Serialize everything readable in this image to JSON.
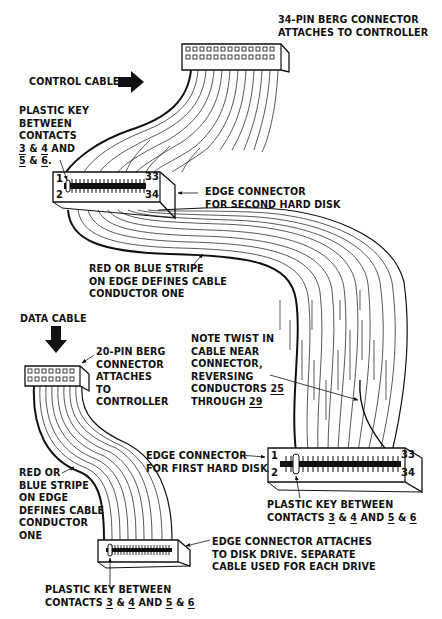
{
  "diagram": {
    "control_cable": {
      "heading": "CONTROL CABLE",
      "berg_connector": [
        "34-PIN BERG CONNECTOR",
        "ATTACHES TO CONTROLLER"
      ],
      "key_label": [
        "PLASTIC KEY",
        "BETWEEN",
        "CONTACTS"
      ],
      "key_contacts_1": {
        "a": "3",
        "amp": " & ",
        "b": "4",
        "and": " AND"
      },
      "key_contacts_2": {
        "a": "5",
        "amp": " & ",
        "b": "6",
        "end": "."
      },
      "second_disk_connector": [
        "EDGE CONNECTOR",
        "FOR SECOND HARD DISK"
      ],
      "stripe_note": [
        "RED OR BLUE STRIPE",
        "ON EDGE DEFINES CABLE",
        "CONDUCTOR ONE"
      ],
      "twist_note": [
        "NOTE TWIST IN",
        "CABLE NEAR",
        "CONNECTOR,",
        "REVERSING"
      ],
      "twist_conductors": {
        "prefix": "CONDUCTORS ",
        "a": "25",
        "through": "THROUGH ",
        "b": "29"
      },
      "first_disk_connector": [
        "EDGE CONNECTOR",
        "FOR FIRST HARD DISK"
      ],
      "first_key_label": "PLASTIC KEY BETWEEN",
      "first_key_contacts": {
        "prefix": "CONTACTS ",
        "a": "3",
        "amp1": " & ",
        "b": "4",
        "and": " AND ",
        "c": "5",
        "amp2": " & ",
        "d": "6"
      },
      "pin_labels": {
        "p1": "1",
        "p2": "2",
        "p33": "33",
        "p34": "34"
      }
    },
    "data_cable": {
      "heading": "DATA CABLE",
      "berg_connector": [
        "20-PIN BERG",
        "CONNECTOR",
        "ATTACHES",
        "TO",
        "CONTROLLER"
      ],
      "stripe_note": [
        "RED OR",
        "BLUE STRIPE",
        "ON EDGE",
        "DEFINES CABLE",
        "CONDUCTOR",
        "ONE"
      ],
      "drive_connector": [
        "EDGE CONNECTOR ATTACHES",
        "TO DISK DRIVE. SEPARATE",
        "CABLE USED FOR EACH DRIVE"
      ],
      "key_label": "PLASTIC KEY BETWEEN",
      "key_contacts": {
        "prefix": "CONTACTS ",
        "a": "3",
        "amp1": " & ",
        "b": "4",
        "and": " AND ",
        "c": "5",
        "amp2": " & ",
        "d": "6"
      }
    },
    "colors": {
      "ink": "#111111",
      "paper": "#ffffff"
    }
  }
}
